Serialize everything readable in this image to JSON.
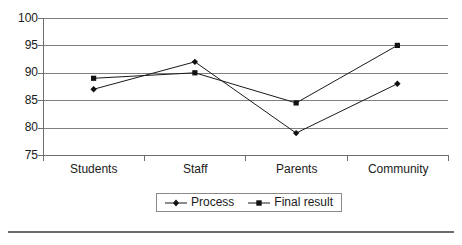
{
  "chart_data": {
    "type": "line",
    "title": "",
    "xlabel": "",
    "ylabel": "",
    "categories": [
      "Students",
      "Staff",
      "Parents",
      "Community"
    ],
    "ylim": [
      75,
      100
    ],
    "yticks": [
      75,
      80,
      85,
      90,
      95,
      100
    ],
    "grid": true,
    "legend_position": "bottom",
    "series": [
      {
        "name": "Process",
        "marker": "diamond",
        "values": [
          87,
          92,
          79,
          88
        ]
      },
      {
        "name": "Final result",
        "marker": "square",
        "values": [
          89,
          90,
          84.5,
          95
        ]
      }
    ]
  },
  "axis": {
    "y_tick_labels": [
      "100",
      "95",
      "90",
      "85",
      "80",
      "75"
    ],
    "x_tick_labels": [
      "Students",
      "Staff",
      "Parents",
      "Community"
    ]
  },
  "legend": {
    "entries": [
      {
        "label": "Process"
      },
      {
        "label": "Final result"
      }
    ]
  },
  "colors": {
    "series_line": "#1a1a1a",
    "gridline": "#808080",
    "axis": "#6e6e6e",
    "text": "#1a1a1a",
    "rule": "#6b6b6b",
    "background": "#ffffff"
  }
}
